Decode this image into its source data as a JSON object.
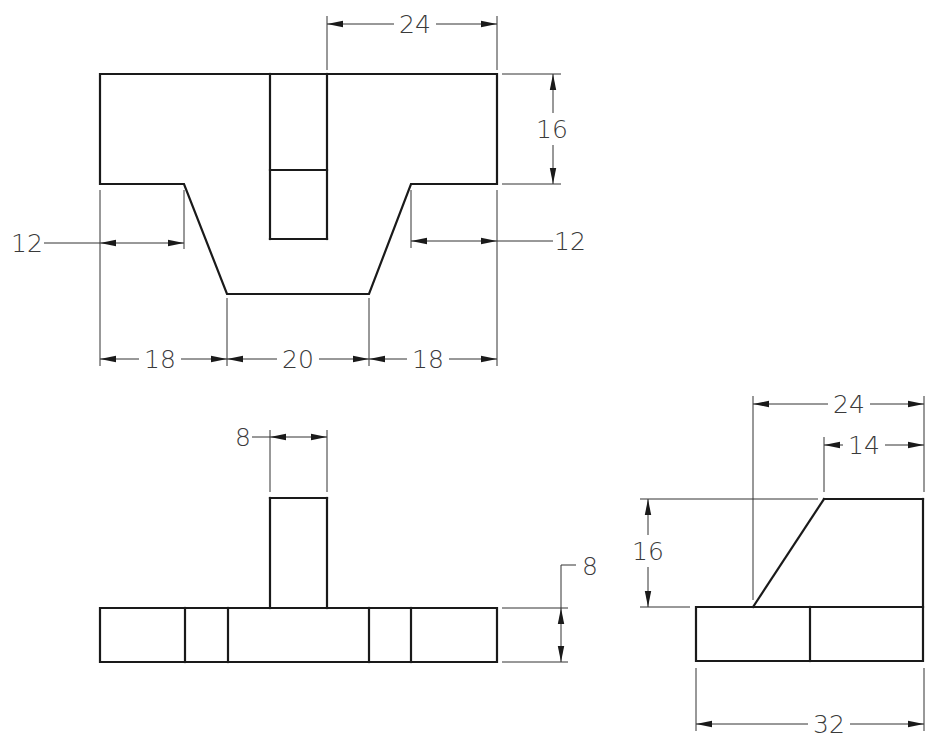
{
  "drawing": {
    "type": "orthographic-projection",
    "colors": {
      "line": "#1a1a1a",
      "dimension": "#333333",
      "text": "#3a3a3a",
      "background": "#ffffff"
    },
    "views": [
      {
        "id": "top-view",
        "name": "top-view",
        "outline": [
          [
            100,
            74
          ],
          [
            497,
            74
          ],
          [
            497,
            184
          ],
          [
            411,
            184
          ],
          [
            369,
            294
          ],
          [
            227,
            294
          ],
          [
            184,
            184
          ],
          [
            100,
            184
          ],
          [
            100,
            74
          ]
        ],
        "lines": [
          [
            [
              270,
              74
            ],
            [
              270,
              239
            ]
          ],
          [
            [
              327,
              74
            ],
            [
              327,
              239
            ]
          ],
          [
            [
              270,
              239
            ],
            [
              327,
              239
            ]
          ],
          [
            [
              270,
              170
            ],
            [
              327,
              170
            ]
          ]
        ]
      },
      {
        "id": "front-view",
        "name": "front-view",
        "outline": [
          [
            100,
            608
          ],
          [
            497,
            608
          ],
          [
            497,
            662
          ],
          [
            100,
            662
          ],
          [
            100,
            608
          ]
        ],
        "lines": [
          [
            [
              185,
              608
            ],
            [
              185,
              662
            ]
          ],
          [
            [
              228,
              608
            ],
            [
              228,
              662
            ]
          ],
          [
            [
              369,
              608
            ],
            [
              369,
              662
            ]
          ],
          [
            [
              411,
              608
            ],
            [
              411,
              662
            ]
          ],
          [
            [
              270,
              608
            ],
            [
              270,
              498
            ]
          ],
          [
            [
              270,
              498
            ],
            [
              327,
              498
            ]
          ],
          [
            [
              327,
              498
            ],
            [
              327,
              608
            ]
          ]
        ]
      },
      {
        "id": "side-view",
        "name": "side-view",
        "outline": [
          [
            696,
            607
          ],
          [
            923,
            607
          ],
          [
            923,
            661
          ],
          [
            696,
            661
          ],
          [
            696,
            607
          ]
        ],
        "lines": [
          [
            [
              810,
              607
            ],
            [
              810,
              661
            ]
          ],
          [
            [
              753,
              607
            ],
            [
              824,
              499
            ]
          ],
          [
            [
              824,
              499
            ],
            [
              923,
              499
            ]
          ],
          [
            [
              923,
              499
            ],
            [
              923,
              607
            ]
          ]
        ]
      }
    ],
    "dimensions": [
      {
        "name": "top-view-width-24",
        "value": "24",
        "orient": "h",
        "y": 24,
        "x1": 327,
        "x2": 497,
        "text_x": 415,
        "ext": [
          [
            [
              327,
              16
            ],
            [
              327,
              70
            ]
          ],
          [
            [
              497,
              16
            ],
            [
              497,
              70
            ]
          ]
        ]
      },
      {
        "name": "top-view-height-16",
        "value": "16",
        "orient": "v",
        "x": 553,
        "y1": 74,
        "y2": 184,
        "text_x": 552,
        "text_y": 129,
        "ext": [
          [
            [
              502,
              74
            ],
            [
              561,
              74
            ]
          ],
          [
            [
              502,
              184
            ],
            [
              561,
              184
            ]
          ]
        ]
      },
      {
        "name": "top-view-left-12",
        "value": "12",
        "orient": "h-out-left",
        "y": 243,
        "x1": 100,
        "x2": 184,
        "text_x": 27,
        "leader": [
          [
            44,
            243
          ],
          [
            100,
            243
          ]
        ],
        "ext": [
          [
            [
              184,
              190
            ],
            [
              184,
              249
            ]
          ]
        ]
      },
      {
        "name": "top-view-right-12",
        "value": "12",
        "orient": "h-out-right",
        "y": 241,
        "x1": 411,
        "x2": 497,
        "text_x": 570,
        "leader": [
          [
            497,
            241
          ],
          [
            553,
            241
          ]
        ],
        "ext": [
          [
            [
              411,
              190
            ],
            [
              411,
              248
            ]
          ]
        ]
      },
      {
        "name": "top-view-bottom-left-18",
        "value": "18",
        "orient": "h",
        "y": 359,
        "x1": 100,
        "x2": 227,
        "text_x": 160,
        "ext": [
          [
            [
              100,
              190
            ],
            [
              100,
              366
            ]
          ],
          [
            [
              227,
              298
            ],
            [
              227,
              366
            ]
          ]
        ]
      },
      {
        "name": "top-view-bottom-middle-20",
        "value": "20",
        "orient": "h",
        "y": 359,
        "x1": 227,
        "x2": 369,
        "text_x": 298,
        "ext": []
      },
      {
        "name": "top-view-bottom-right-18",
        "value": "18",
        "orient": "h",
        "y": 359,
        "x1": 369,
        "x2": 497,
        "text_x": 428,
        "ext": [
          [
            [
              369,
              298
            ],
            [
              369,
              366
            ]
          ],
          [
            [
              497,
              190
            ],
            [
              497,
              366
            ]
          ]
        ]
      },
      {
        "name": "front-view-post-width-8",
        "value": "8",
        "orient": "h-text-left",
        "y": 437,
        "x1": 270,
        "x2": 327,
        "text_x": 243,
        "leader": [
          [
            252,
            437
          ],
          [
            270,
            437
          ]
        ],
        "ext": [
          [
            [
              270,
              430
            ],
            [
              270,
              492
            ]
          ],
          [
            [
              327,
              430
            ],
            [
              327,
              492
            ]
          ]
        ]
      },
      {
        "name": "front-view-base-height-8",
        "value": "8",
        "orient": "v-leader",
        "x": 561,
        "y1": 608,
        "y2": 662,
        "text_x": 590,
        "text_y": 566,
        "leader": [
          [
            561,
            608
          ],
          [
            561,
            565
          ],
          [
            576,
            565
          ]
        ],
        "ext": [
          [
            [
              502,
              608
            ],
            [
              568,
              608
            ]
          ],
          [
            [
              502,
              662
            ],
            [
              568,
              662
            ]
          ]
        ]
      },
      {
        "name": "side-view-width-24",
        "value": "24",
        "orient": "h",
        "y": 404,
        "x1": 753,
        "x2": 924,
        "text_x": 849,
        "ext": [
          [
            [
              753,
              396
            ],
            [
              753,
              600
            ]
          ],
          [
            [
              924,
              396
            ],
            [
              924,
              492
            ]
          ]
        ]
      },
      {
        "name": "side-view-top-14",
        "value": "14",
        "orient": "h",
        "y": 445,
        "x1": 824,
        "x2": 924,
        "text_x": 864,
        "ext": [
          [
            [
              824,
              437
            ],
            [
              824,
              492
            ]
          ]
        ]
      },
      {
        "name": "side-view-height-16",
        "value": "16",
        "orient": "v",
        "x": 648,
        "y1": 499,
        "y2": 607,
        "text_x": 648,
        "text_y": 551,
        "ext": [
          [
            [
              640,
              499
            ],
            [
              818,
              499
            ]
          ],
          [
            [
              640,
              607
            ],
            [
              690,
              607
            ]
          ]
        ]
      },
      {
        "name": "side-view-base-width-32",
        "value": "32",
        "orient": "h",
        "y": 724,
        "x1": 696,
        "x2": 924,
        "text_x": 829,
        "ext": [
          [
            [
              696,
              668
            ],
            [
              696,
              731
            ]
          ],
          [
            [
              924,
              668
            ],
            [
              924,
              731
            ]
          ]
        ]
      }
    ]
  }
}
